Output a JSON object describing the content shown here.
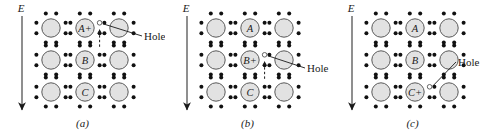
{
  "figure": {
    "type": "physics-lattice-hole-conduction-diagram",
    "width": 495,
    "height": 131,
    "background_color": "#ffffff",
    "ink_color": "#1a1a1a",
    "atom_fill_color": "#e2e2e2",
    "atom_stroke_color": "#5a5a5a",
    "electron_dot_color": "#111111",
    "hole_fill_color": "#ffffff",
    "hole_stroke_color": "#555555"
  },
  "panels": [
    {
      "id": "a",
      "caption": "(a)",
      "field_label": "E",
      "hole_label": "Hole",
      "atoms": [
        {
          "row": 0,
          "col": 0,
          "label": ""
        },
        {
          "row": 0,
          "col": 1,
          "label": "A+"
        },
        {
          "row": 0,
          "col": 2,
          "label": ""
        },
        {
          "row": 1,
          "col": 0,
          "label": ""
        },
        {
          "row": 1,
          "col": 1,
          "label": "B"
        },
        {
          "row": 1,
          "col": 2,
          "label": ""
        },
        {
          "row": 2,
          "col": 0,
          "label": ""
        },
        {
          "row": 2,
          "col": 1,
          "label": "C"
        },
        {
          "row": 2,
          "col": 2,
          "label": ""
        }
      ],
      "hole_position": {
        "row": 0,
        "side": "right-of-center"
      },
      "motion_arrow": "up"
    },
    {
      "id": "b",
      "caption": "(b)",
      "field_label": "E",
      "hole_label": "Hole",
      "atoms": [
        {
          "row": 0,
          "col": 0,
          "label": ""
        },
        {
          "row": 0,
          "col": 1,
          "label": "A"
        },
        {
          "row": 0,
          "col": 2,
          "label": ""
        },
        {
          "row": 1,
          "col": 0,
          "label": ""
        },
        {
          "row": 1,
          "col": 1,
          "label": "B+"
        },
        {
          "row": 1,
          "col": 2,
          "label": ""
        },
        {
          "row": 2,
          "col": 0,
          "label": ""
        },
        {
          "row": 2,
          "col": 1,
          "label": "C"
        },
        {
          "row": 2,
          "col": 2,
          "label": ""
        }
      ],
      "hole_position": {
        "row": 1,
        "side": "right-of-center"
      },
      "motion_arrow": "up"
    },
    {
      "id": "c",
      "caption": "(c)",
      "field_label": "E",
      "hole_label": "Hole",
      "atoms": [
        {
          "row": 0,
          "col": 0,
          "label": ""
        },
        {
          "row": 0,
          "col": 1,
          "label": "A"
        },
        {
          "row": 0,
          "col": 2,
          "label": ""
        },
        {
          "row": 1,
          "col": 0,
          "label": ""
        },
        {
          "row": 1,
          "col": 1,
          "label": "B"
        },
        {
          "row": 1,
          "col": 2,
          "label": ""
        },
        {
          "row": 2,
          "col": 0,
          "label": ""
        },
        {
          "row": 2,
          "col": 1,
          "label": "C+"
        },
        {
          "row": 2,
          "col": 2,
          "label": ""
        }
      ],
      "hole_position": {
        "row": 2,
        "side": "right-of-center"
      },
      "motion_arrow": "none"
    }
  ]
}
